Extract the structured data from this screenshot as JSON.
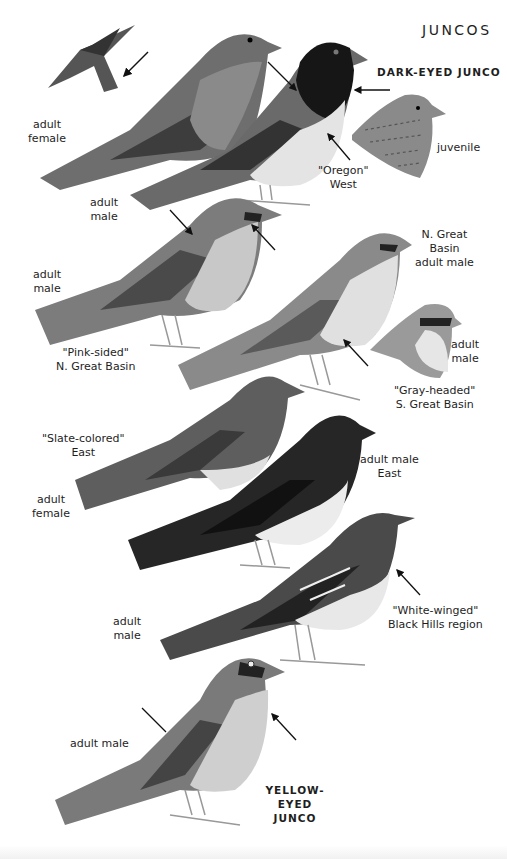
{
  "page": {
    "title": "JUNCOS",
    "colors": {
      "background": "#ffffff",
      "ink": "#1e1e1e",
      "dark_hood": "#1a1a1a",
      "slate": "#4a4a4a",
      "gray": "#8c8c8c",
      "pale": "#e6e6e6"
    }
  },
  "species": [
    {
      "name": "DARK-EYED JUNCO"
    },
    {
      "name_line1": "YELLOW-EYED",
      "name_line2": "JUNCO"
    }
  ],
  "labels": {
    "oregon_female": {
      "line1": "adult",
      "line2": "female"
    },
    "oregon_male": {
      "line1": "adult",
      "line2": "male"
    },
    "oregon_form": {
      "line1": "\"Oregon\"",
      "line2": "West"
    },
    "juvenile": {
      "line1": "juvenile"
    },
    "pink_sided_male": {
      "line1": "adult",
      "line2": "male"
    },
    "pink_sided_form": {
      "line1": "\"Pink-sided\"",
      "line2": "N. Great Basin"
    },
    "gray_headed_ngb": {
      "line1": "N. Great",
      "line2": "Basin",
      "line3": "adult male"
    },
    "gray_headed_head": {
      "line1": "adult",
      "line2": "male"
    },
    "gray_headed_form": {
      "line1": "\"Gray-headed\"",
      "line2": "S. Great Basin"
    },
    "slate_form": {
      "line1": "\"Slate-colored\"",
      "line2": "East"
    },
    "slate_female": {
      "line1": "adult",
      "line2": "female"
    },
    "slate_male": {
      "line1": "adult male",
      "line2": "East"
    },
    "white_winged_male": {
      "line1": "adult",
      "line2": "male"
    },
    "white_winged_form": {
      "line1": "\"White-winged\"",
      "line2": "Black Hills region"
    },
    "yellow_eyed_male": {
      "line1": "adult male"
    }
  }
}
